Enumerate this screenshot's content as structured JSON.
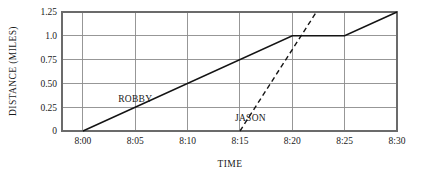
{
  "chart_data": {
    "type": "line",
    "title": "",
    "xlabel": "TIME",
    "ylabel": "DISTANCE (MILES)",
    "x_tick_labels": [
      "8:00",
      "8:05",
      "8:10",
      "8:15",
      "8:20",
      "8:25",
      "8:30"
    ],
    "x_tick_values": [
      0,
      5,
      10,
      15,
      20,
      25,
      30
    ],
    "y_tick_labels": [
      "0",
      "0.25",
      "0.50",
      "0.75",
      "1.0",
      "1.25"
    ],
    "y_tick_values": [
      0,
      0.25,
      0.5,
      0.75,
      1.0,
      1.25
    ],
    "xlim": [
      -2,
      30
    ],
    "ylim": [
      0,
      1.25
    ],
    "grid": true,
    "legend": "inline-labels",
    "series": [
      {
        "name": "ROBBY",
        "style": "solid",
        "color": "#141414",
        "label_x": 5.0,
        "label_y": 0.3,
        "points": [
          {
            "x": 0,
            "y": 0.0,
            "time": "8:00",
            "distance": 0.0
          },
          {
            "x": 20,
            "y": 1.0,
            "time": "8:20",
            "distance": 1.0
          },
          {
            "x": 25,
            "y": 1.0,
            "time": "8:25",
            "distance": 1.0
          },
          {
            "x": 30,
            "y": 1.25,
            "time": "8:30",
            "distance": 1.25
          }
        ]
      },
      {
        "name": "JASON",
        "style": "dashed",
        "color": "#141414",
        "label_x": 16.0,
        "label_y": 0.1,
        "points": [
          {
            "x": 15,
            "y": 0.0,
            "time": "8:15",
            "distance": 0.0
          },
          {
            "x": 22.3,
            "y": 1.25,
            "time": "8:22",
            "distance": 1.25
          }
        ]
      }
    ]
  }
}
